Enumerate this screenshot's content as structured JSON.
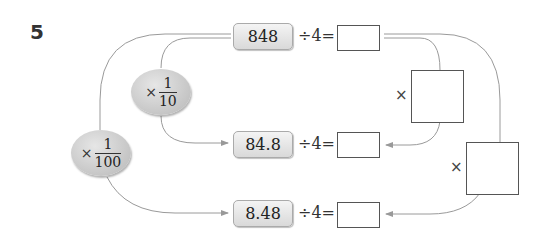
{
  "problem": {
    "number": "5"
  },
  "rows": [
    {
      "value": "848",
      "operation": "÷4=",
      "answer": ""
    },
    {
      "value": "84.8",
      "operation": "÷4=",
      "answer": ""
    },
    {
      "value": "8.48",
      "operation": "÷4=",
      "answer": ""
    }
  ],
  "left_multipliers": [
    {
      "symbol": "×",
      "numerator": "1",
      "denominator": "10"
    },
    {
      "symbol": "×",
      "numerator": "1",
      "denominator": "100"
    }
  ],
  "right_multipliers": [
    {
      "symbol": "×",
      "answer": ""
    },
    {
      "symbol": "×",
      "answer": ""
    }
  ],
  "colors": {
    "line": "#999999",
    "box_border": "#555555",
    "chip_fill": "#d9d9d9"
  }
}
